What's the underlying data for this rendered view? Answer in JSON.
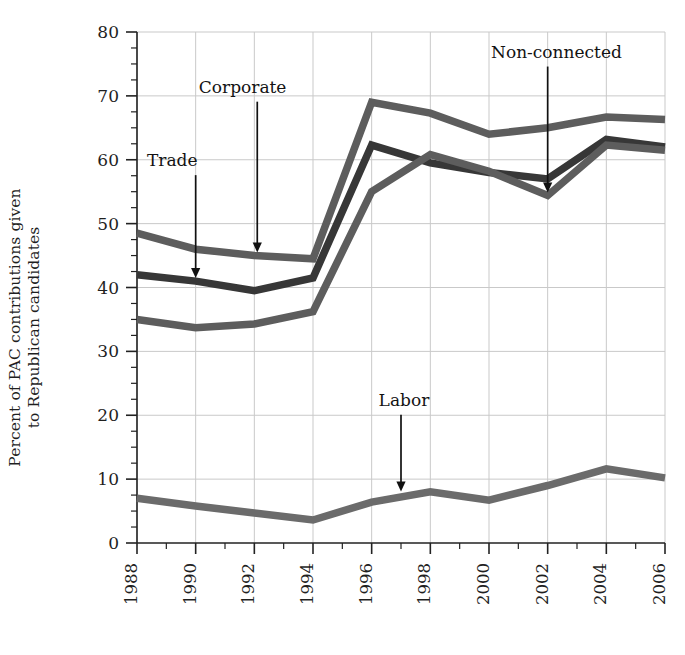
{
  "chart_data": {
    "type": "line",
    "title": "",
    "xlabel": "",
    "ylabel": "Percent of PAC contributions given\nto Republican candidates",
    "x": [
      1988,
      1990,
      1992,
      1994,
      1996,
      1998,
      2000,
      2002,
      2004,
      2006
    ],
    "categories": [
      "1988",
      "1990",
      "1992",
      "1994",
      "1996",
      "1998",
      "2000",
      "2002",
      "2004",
      "2006"
    ],
    "xlim": [
      1988,
      2006
    ],
    "ylim": [
      0,
      80
    ],
    "ytick_labels": [
      "0",
      "10",
      "20",
      "30",
      "40",
      "50",
      "60",
      "70",
      "80"
    ],
    "ytick_values": [
      0,
      10,
      20,
      30,
      40,
      50,
      60,
      70,
      80
    ],
    "yminor_step": 2.5,
    "grid": true,
    "grid_axis": "both",
    "legend": "none",
    "legend_position": "inline-annotations",
    "series": [
      {
        "name": "Corporate",
        "color": "#5d5d5d",
        "values": [
          48.5,
          46.0,
          45.0,
          44.5,
          69.0,
          67.3,
          64.0,
          65.0,
          66.7,
          66.3
        ]
      },
      {
        "name": "Trade",
        "color": "#373737",
        "values": [
          42.0,
          41.0,
          39.5,
          41.5,
          62.3,
          59.5,
          58.0,
          57.0,
          63.2,
          62.0
        ]
      },
      {
        "name": "Non-connected",
        "color": "#5d5d5d",
        "values": [
          35.0,
          33.7,
          34.3,
          36.2,
          55.0,
          60.8,
          58.2,
          54.4,
          62.3,
          61.5
        ]
      },
      {
        "name": "Labor",
        "color": "#6b6b6b",
        "values": [
          7.0,
          5.8,
          4.7,
          3.6,
          6.4,
          8.0,
          6.7,
          9.0,
          11.6,
          10.2
        ]
      }
    ],
    "annotations": [
      {
        "text": "Trade",
        "label_x": 1989.2,
        "label_y": 59.0,
        "target_x": 1990.0,
        "target_y": 41.0
      },
      {
        "text": "Corporate",
        "label_x": 1991.6,
        "label_y": 70.5,
        "target_x": 1992.1,
        "target_y": 45.0
      },
      {
        "text": "Non-connected",
        "label_x": 2002.3,
        "label_y": 76.0,
        "target_x": 2002.0,
        "target_y": 54.4
      },
      {
        "text": "Labor",
        "label_x": 1997.1,
        "label_y": 21.5,
        "target_x": 1997.0,
        "target_y": 7.6
      }
    ]
  }
}
